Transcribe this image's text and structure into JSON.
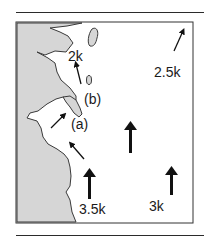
{
  "figure": {
    "type": "coastal current map",
    "colors": {
      "land": "#d6d6d6",
      "water": "#ffffff",
      "outline": "#3a3a3a",
      "arrow": "#111111"
    },
    "site_labels": [
      "(a)",
      "(b)"
    ],
    "speed_labels": [
      "2k",
      "2.5k",
      "3.5k",
      "3k"
    ],
    "arrows": [
      {
        "id": "arrow-2k",
        "direction": "north-northwest",
        "weight": "thin",
        "label": "2k"
      },
      {
        "id": "arrow-2.5k",
        "direction": "northeast",
        "weight": "thin",
        "label": "2.5k"
      },
      {
        "id": "arrow-a-upper",
        "direction": "northeast",
        "weight": "thin"
      },
      {
        "id": "arrow-a-lower",
        "direction": "northwest",
        "weight": "thin"
      },
      {
        "id": "arrow-center",
        "direction": "north",
        "weight": "thick"
      },
      {
        "id": "arrow-3.5k",
        "direction": "north",
        "weight": "thick",
        "label": "3.5k"
      },
      {
        "id": "arrow-3k",
        "direction": "north",
        "weight": "thick",
        "label": "3k"
      }
    ]
  }
}
